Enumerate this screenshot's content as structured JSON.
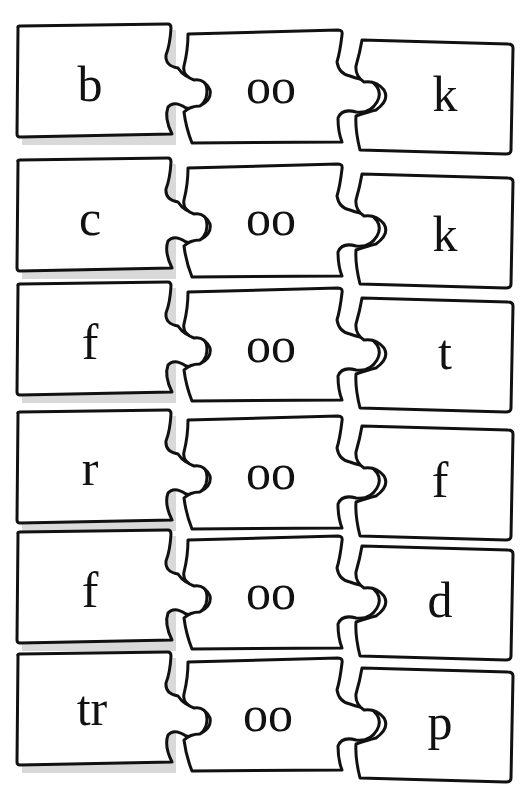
{
  "worksheet": {
    "theme": "oo word puzzles",
    "rows": [
      {
        "onset": "b",
        "vowel": "oo",
        "coda": "k",
        "word": "book"
      },
      {
        "onset": "c",
        "vowel": "oo",
        "coda": "k",
        "word": "cook"
      },
      {
        "onset": "f",
        "vowel": "oo",
        "coda": "t",
        "word": "foot"
      },
      {
        "onset": "r",
        "vowel": "oo",
        "coda": "f",
        "word": "roof"
      },
      {
        "onset": "f",
        "vowel": "oo",
        "coda": "d",
        "word": "food"
      },
      {
        "onset": "tr",
        "vowel": "oo",
        "coda": "p",
        "word": "troop"
      }
    ]
  },
  "colors": {
    "outline": "#111111",
    "piece_fill": "#ffffff",
    "shadow": "#d9d9d9",
    "background": "#ffffff"
  }
}
